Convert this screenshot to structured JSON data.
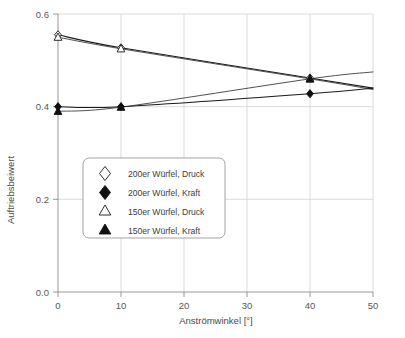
{
  "chart_data": {
    "type": "line",
    "title": "",
    "subtitle": "",
    "xlabel": "Anströmwinkel [°]",
    "ylabel": "Auftriebsbeiwert",
    "xlim": [
      0,
      50
    ],
    "ylim": [
      0.0,
      0.6
    ],
    "xticks": [
      "0",
      "10",
      "20",
      "30",
      "40",
      "50"
    ],
    "xtick_values": [
      0,
      10,
      20,
      30,
      40,
      50
    ],
    "yticks": [
      "0.0",
      "0.2",
      "0.4",
      "0.6"
    ],
    "ytick_values": [
      0.0,
      0.2,
      0.4,
      0.6
    ],
    "grid": true,
    "legend_position": "center-left",
    "x": [
      0,
      10,
      40,
      50
    ],
    "series": [
      {
        "name": "200er Würfel, Druck",
        "marker": "diamond-open",
        "x": [
          0,
          10,
          40
        ],
        "values": [
          0.555,
          0.527,
          0.462
        ],
        "line_x": [
          0,
          10,
          40,
          50
        ],
        "line_values": [
          0.555,
          0.527,
          0.462,
          0.44
        ]
      },
      {
        "name": "200er Würfel, Kraft",
        "marker": "diamond-filled",
        "x": [
          0,
          10,
          40
        ],
        "values": [
          0.4,
          0.4,
          0.428
        ],
        "line_x": [
          0,
          10,
          40,
          50
        ],
        "line_values": [
          0.4,
          0.4,
          0.428,
          0.44
        ]
      },
      {
        "name": "150er Würfel, Druck",
        "marker": "triangle-open",
        "x": [
          0,
          10,
          40
        ],
        "values": [
          0.55,
          0.525,
          0.46
        ],
        "line_x": [
          0,
          10,
          40,
          50
        ],
        "line_values": [
          0.55,
          0.525,
          0.46,
          0.437
        ]
      },
      {
        "name": "150er Würfel, Kraft",
        "marker": "triangle-filled",
        "x": [
          0,
          10,
          40
        ],
        "values": [
          0.39,
          0.399,
          0.46
        ],
        "line_x": [
          0,
          10,
          40,
          50
        ],
        "line_values": [
          0.39,
          0.399,
          0.46,
          0.475
        ]
      }
    ],
    "legend_entries": [
      {
        "label": "200er Würfel, Druck",
        "marker": "diamond-open"
      },
      {
        "label": "200er Würfel, Kraft",
        "marker": "diamond-filled"
      },
      {
        "label": "150er Würfel, Druck",
        "marker": "triangle-open"
      },
      {
        "label": "150er Würfel, Kraft",
        "marker": "triangle-filled"
      }
    ],
    "colors": {
      "line": "#1a1a1a",
      "grid": "#d2d2d2",
      "axis": "#8c8c8c",
      "text": "#3d3d3d",
      "background": "#ffffff"
    }
  }
}
